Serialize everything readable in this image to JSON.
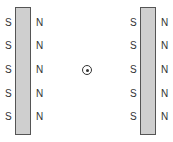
{
  "diagram": {
    "left_magnet": {
      "left_labels": [
        "S",
        "S",
        "S",
        "S",
        "S"
      ],
      "right_labels": [
        "N",
        "N",
        "N",
        "N",
        "N"
      ]
    },
    "right_magnet": {
      "left_labels": [
        "S",
        "S",
        "S",
        "S",
        "S"
      ],
      "right_labels": [
        "N",
        "N",
        "N",
        "N",
        "N"
      ]
    },
    "center_symbol": "out-of-page-dot"
  }
}
